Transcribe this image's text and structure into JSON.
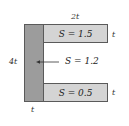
{
  "diagram": {
    "type": "channel-cross-section",
    "labels": {
      "top_width": "2t",
      "height": "4t",
      "web_thickness": "t",
      "top_flange_thickness": "t",
      "bottom_flange_thickness": "t"
    },
    "regions": {
      "top_flange": {
        "label": "S = 1.5"
      },
      "web": {
        "label": "S = 1.2"
      },
      "bottom_flange": {
        "label": "S = 0.5"
      }
    },
    "colors": {
      "web_fill": "#9c9c9c",
      "flange_fill": "#d4d4d4",
      "outline": "#5a5a5a"
    }
  }
}
